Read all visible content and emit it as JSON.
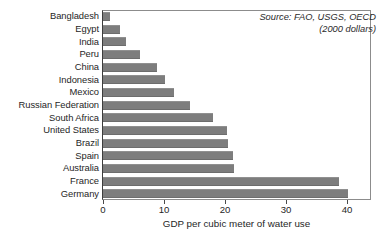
{
  "chart_data": {
    "type": "bar",
    "orientation": "horizontal",
    "title": "",
    "xlabel": "GDP per cubic meter of water use",
    "ylabel": "",
    "xlim": [
      0,
      44
    ],
    "xticks": [
      0,
      10,
      20,
      30,
      40
    ],
    "xtick_labels": [
      "0",
      "10",
      "20",
      "30",
      "40"
    ],
    "grid": false,
    "legend": false,
    "bar_color": "#7d7d7d",
    "categories": [
      "Bangladesh",
      "Egypt",
      "India",
      "Peru",
      "China",
      "Indonesia",
      "Mexico",
      "Russian Federation",
      "South Africa",
      "United States",
      "Brazil",
      "Spain",
      "Australia",
      "France",
      "Germany"
    ],
    "values": [
      1.1,
      2.8,
      3.8,
      6.1,
      8.9,
      10.2,
      11.6,
      14.3,
      18.0,
      20.3,
      20.5,
      21.3,
      21.5,
      38.7,
      40.2
    ],
    "annotations": [
      "Source: FAO, USGS, OECD",
      "(2000 dollars)"
    ]
  },
  "source": {
    "line1": "Source: FAO, USGS, OECD",
    "line2": "(2000 dollars)"
  }
}
